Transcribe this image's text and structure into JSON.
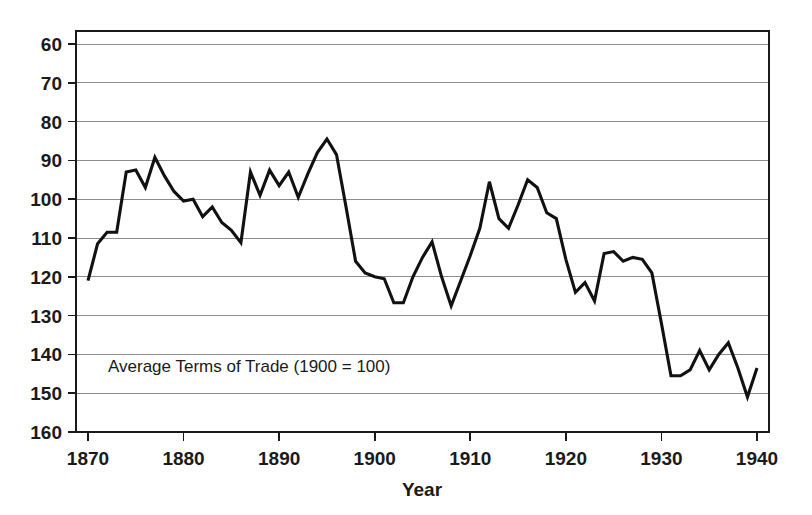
{
  "chart_data": {
    "type": "line",
    "title": "",
    "annotation": "Average Terms of Trade (1900 = 100)",
    "xlabel": "Year",
    "ylabel": "",
    "xlim": [
      1870,
      1940
    ],
    "ylim": [
      60,
      160
    ],
    "grid": true,
    "legend": false,
    "xticks": [
      1870,
      1880,
      1890,
      1900,
      1910,
      1920,
      1930,
      1940
    ],
    "yticks": [
      60,
      70,
      80,
      90,
      100,
      110,
      120,
      130,
      140,
      150,
      160
    ],
    "line_color": "#111111",
    "grid_color": "#8d8d8d",
    "frame_color": "#1a1a1a",
    "series": [
      {
        "name": "Average Terms of Trade (1900 = 100)",
        "x": [
          1870,
          1871,
          1872,
          1873,
          1874,
          1875,
          1876,
          1877,
          1878,
          1879,
          1880,
          1881,
          1882,
          1883,
          1884,
          1885,
          1886,
          1887,
          1888,
          1889,
          1890,
          1891,
          1892,
          1893,
          1894,
          1895,
          1896,
          1897,
          1898,
          1899,
          1900,
          1901,
          1902,
          1903,
          1904,
          1905,
          1906,
          1907,
          1908,
          1909,
          1910,
          1911,
          1912,
          1913,
          1914,
          1915,
          1916,
          1917,
          1918,
          1919,
          1920,
          1921,
          1922,
          1923,
          1924,
          1925,
          1926,
          1927,
          1928,
          1929,
          1930,
          1931,
          1932,
          1933,
          1934,
          1935,
          1936,
          1937,
          1938,
          1939,
          1940
        ],
        "values": [
          99.0,
          108.5,
          111.5,
          111.5,
          127.0,
          127.5,
          123.0,
          130.8,
          126.0,
          122.0,
          119.5,
          120.0,
          115.5,
          118.0,
          114.0,
          112.0,
          108.8,
          127.0,
          121.0,
          127.5,
          123.5,
          127.0,
          120.5,
          126.5,
          132.0,
          135.5,
          131.5,
          118.0,
          104.0,
          101.0,
          100.0,
          99.5,
          93.3,
          93.3,
          100.0,
          105.0,
          109.0,
          100.0,
          92.5,
          99.0,
          105.5,
          112.5,
          124.5,
          115.0,
          112.5,
          118.5,
          125.0,
          123.0,
          116.5,
          115.0,
          104.5,
          96.0,
          98.5,
          93.8,
          106.0,
          106.5,
          104.0,
          105.0,
          104.5,
          101.0,
          88.0,
          74.5,
          74.5,
          76.0,
          81.0,
          76.0,
          80.0,
          83.0,
          76.5,
          69.0,
          76.5
        ]
      }
    ]
  },
  "labels": {
    "y": [
      "160",
      "150",
      "140",
      "130",
      "120",
      "110",
      "100",
      "90",
      "80",
      "70",
      "60"
    ],
    "x": [
      "1870",
      "1880",
      "1890",
      "1900",
      "1910",
      "1920",
      "1930",
      "1940"
    ],
    "xaxis_title": "Year",
    "annotation": "Average Terms of Trade (1900 = 100)"
  }
}
